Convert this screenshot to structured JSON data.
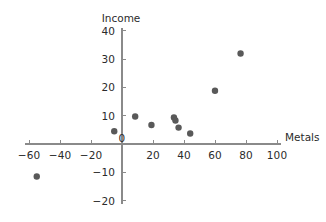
{
  "chart_data": {
    "type": "scatter",
    "title": "",
    "xlabel": "Metals",
    "ylabel": "Income",
    "xlim": [
      -65,
      105
    ],
    "ylim": [
      -20,
      40
    ],
    "xticks": [
      -60,
      -40,
      -20,
      0,
      20,
      40,
      60,
      80,
      100
    ],
    "xticklabels": [
      "−60",
      "−40",
      "−20",
      "0",
      "20",
      "40",
      "60",
      "80",
      "100"
    ],
    "yticks": [
      -20,
      -10,
      0,
      10,
      20,
      30,
      40
    ],
    "yticklabels": [
      "−20",
      "−10",
      "0",
      "10",
      "20",
      "30",
      "40"
    ],
    "grid": false,
    "legend": false,
    "marker_color": "#595959",
    "marker_size": 3.2,
    "axis_color": "#8a8a8a",
    "points": [
      {
        "x": -55,
        "y": -11.5
      },
      {
        "x": -5,
        "y": 4.5
      },
      {
        "x": 8.5,
        "y": 9.7
      },
      {
        "x": 19,
        "y": 6.7
      },
      {
        "x": 33.5,
        "y": 9.4
      },
      {
        "x": 34.5,
        "y": 8.3
      },
      {
        "x": 36.5,
        "y": 5.8
      },
      {
        "x": 44,
        "y": 3.7
      },
      {
        "x": 60,
        "y": 18.8
      },
      {
        "x": 76.5,
        "y": 32
      }
    ]
  }
}
